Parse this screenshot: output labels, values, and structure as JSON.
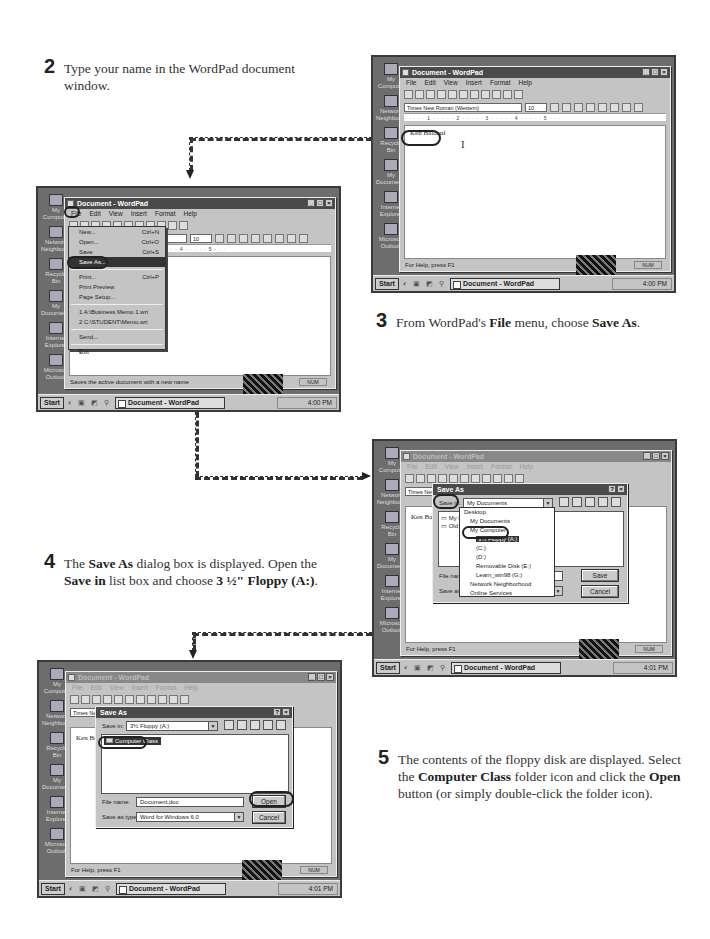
{
  "steps": [
    {
      "number": "2",
      "parts": [
        {
          "t": "Type your name in the WordPad document window.",
          "b": false
        }
      ]
    },
    {
      "number": "3",
      "parts": [
        {
          "t": "From WordPad's ",
          "b": false
        },
        {
          "t": "File",
          "b": true
        },
        {
          "t": " menu, choose ",
          "b": false
        },
        {
          "t": "Save As",
          "b": true
        },
        {
          "t": ".",
          "b": false
        }
      ]
    },
    {
      "number": "4",
      "parts": [
        {
          "t": "The ",
          "b": false
        },
        {
          "t": "Save As",
          "b": true
        },
        {
          "t": " dialog box is displayed. Open the ",
          "b": false
        },
        {
          "t": "Save in",
          "b": true
        },
        {
          "t": " list box and choose ",
          "b": false
        },
        {
          "t": "3 ½\" Floppy (A:)",
          "b": true
        },
        {
          "t": ".",
          "b": false
        }
      ]
    },
    {
      "number": "5",
      "parts": [
        {
          "t": "The contents of the floppy disk are displayed. Select the ",
          "b": false
        },
        {
          "t": "Computer Class",
          "b": true
        },
        {
          "t": " folder icon and click the ",
          "b": false
        },
        {
          "t": "Open",
          "b": true
        },
        {
          "t": " button (or simply double-click the folder icon).",
          "b": false
        }
      ]
    }
  ],
  "desktop_icons": [
    "My Computer",
    "Network Neighborhood",
    "Recycle Bin",
    "My Documents",
    "Internet Explorer",
    "Microsoft Outlook"
  ],
  "wordpad": {
    "title": "Document - WordPad",
    "menus": [
      "File",
      "Edit",
      "View",
      "Insert",
      "Format",
      "Help"
    ],
    "font": "Times New Roman (Western)",
    "size": "10",
    "ruler": "·····1·····2·····3·····4·····5···",
    "status_help": "For Help, press F1",
    "status_num": "NUM"
  },
  "taskbar": {
    "start": "Start",
    "quicklaunch": "◐ ▣ ◩ ⚲",
    "task": "Document - WordPad",
    "time_shot1": "4:00 PM",
    "time_shot2": "4:00 PM",
    "time_shot3": "4:01 PM",
    "time_shot4": "4:01 PM"
  },
  "shot1": {
    "typed_name": "Ken Baldauf"
  },
  "shot2": {
    "file_menu": [
      {
        "label": "New...",
        "shortcut": "Ctrl+N"
      },
      {
        "label": "Open...",
        "shortcut": "Ctrl+O"
      },
      {
        "label": "Save",
        "shortcut": "Ctrl+S"
      },
      {
        "label": "Save As...",
        "shortcut": ""
      },
      {
        "label": "Print...",
        "shortcut": "Ctrl+P"
      },
      {
        "label": "Print Preview",
        "shortcut": ""
      },
      {
        "label": "Page Setup...",
        "shortcut": ""
      },
      {
        "label": "1 A:\\Business Memo 1.wri",
        "shortcut": ""
      },
      {
        "label": "2 C:\\STUDENT\\Memo.wri",
        "shortcut": ""
      },
      {
        "label": "Send...",
        "shortcut": ""
      },
      {
        "label": "Exit",
        "shortcut": ""
      }
    ],
    "status_help": "Saves the active document with a new name"
  },
  "save_dialog": {
    "title": "Save As",
    "save_in_label": "Save in:",
    "file_name_label": "File name:",
    "save_type_label": "Save as type:",
    "save_type": "Word for Windows 6.0",
    "help_btn": "?",
    "close_btn": "×",
    "cancel": "Cancel"
  },
  "shot3": {
    "save_in": "My Documents",
    "file_name": "Document.doc",
    "save_button": "Save",
    "list_items": [
      "My Pi...",
      "Old E..."
    ],
    "doc_text": "Ken Bal",
    "dropdown": [
      "Desktop",
      "My Documents",
      "My Computer",
      "3½ Floppy (A:)",
      "(C:)",
      "(D:)",
      "Removable Disk (E:)",
      "Learn_win98 (G:)",
      "Network Neighborhood",
      "Online Services"
    ]
  },
  "shot4": {
    "save_in": "3½ Floppy (A:)",
    "folder": "Computer Class",
    "file_name": "Document.doc",
    "open_button": "Open",
    "doc_text": "Ken Bal"
  },
  "colors": {
    "desktop": "#6d6d6d",
    "window": "#c4c4c4",
    "titlebar": "#4a4a4a",
    "highlight": "#333333"
  }
}
